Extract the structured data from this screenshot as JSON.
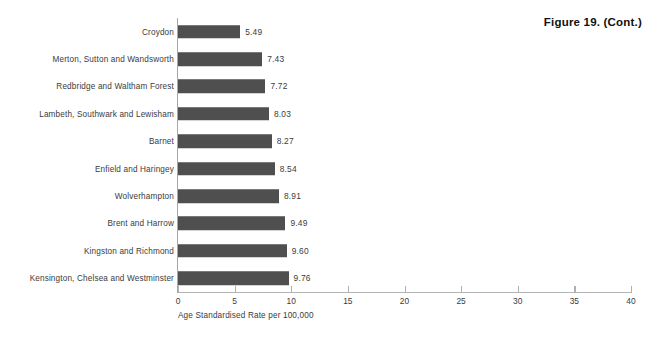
{
  "figure": {
    "caption": "Figure 19. (Cont.)"
  },
  "chart_data": {
    "type": "bar",
    "orientation": "horizontal",
    "title": "Figure 19. (Cont.)",
    "xlabel": "Age Standardised Rate per 100,000",
    "ylabel": "",
    "xlim": [
      0,
      40
    ],
    "xticks": [
      0,
      5,
      10,
      15,
      20,
      25,
      30,
      35,
      40
    ],
    "xtick_labels": [
      "0",
      "5",
      "10",
      "15",
      "20",
      "25",
      "30",
      "35",
      "40"
    ],
    "grid": false,
    "legend": null,
    "bar_color": "#4f4f4f",
    "categories": [
      "Croydon",
      "Merton, Sutton and Wandsworth",
      "Redbridge and Waltham Forest",
      "Lambeth, Southwark and Lewisham",
      "Barnet",
      "Enfield and Haringey",
      "Wolverhampton",
      "Brent and Harrow",
      "Kingston and Richmond",
      "Kensington, Chelsea and Westminster"
    ],
    "values": [
      5.49,
      7.43,
      7.72,
      8.03,
      8.27,
      8.54,
      8.91,
      9.49,
      9.6,
      9.76
    ],
    "value_labels": [
      "5.49",
      "7.43",
      "7.72",
      "8.03",
      "8.27",
      "8.54",
      "8.91",
      "9.49",
      "9.60",
      "9.76"
    ]
  }
}
